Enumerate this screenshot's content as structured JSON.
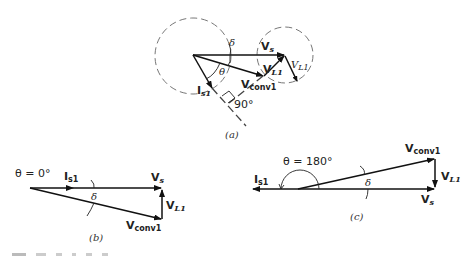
{
  "diagram": {
    "panel_a": {
      "caption": "(a)",
      "labels": {
        "vs": "V",
        "vs_sub": "s",
        "vl1_inner": "V",
        "vl1_inner_sub": "L1",
        "vl1_outer": "V",
        "vl1_outer_sub": "L1",
        "vconv": "V",
        "vconv_sub": "conv1",
        "is1": "I",
        "is1_sub": "s1",
        "delta": "δ",
        "theta": "θ",
        "right_angle": "90°"
      }
    },
    "panel_b": {
      "caption": "(b)",
      "labels": {
        "theta": "θ = 0°",
        "is1": "I",
        "is1_sub": "s1",
        "vs": "V",
        "vs_sub": "s",
        "delta": "δ",
        "vl1": "V",
        "vl1_sub": "L1",
        "vconv": "V",
        "vconv_sub": "conv1"
      }
    },
    "panel_c": {
      "caption": "(c)",
      "labels": {
        "theta": "θ = 180°",
        "is1": "I",
        "is1_sub": "s1",
        "vconv": "V",
        "vconv_sub": "conv1",
        "vl1": "V",
        "vl1_sub": "L1",
        "delta": "δ",
        "vs": "V",
        "vs_sub": "s"
      }
    }
  }
}
